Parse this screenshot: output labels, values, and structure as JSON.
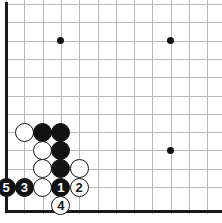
{
  "figure": {
    "kind": "go-board-diagram",
    "title": "",
    "board_region": "bottom-left corner",
    "background_color": "#ffffff",
    "grid_line_color": "#b9b9b9",
    "border_color": "#1a1a1a",
    "black_stone_color": "#121212",
    "white_stone_color": "#ffffff",
    "columns": 12,
    "rows": 11,
    "grid_spacing_px": 18.3,
    "origin_x_px": 6,
    "origin_y_px": 4,
    "stone_diameter_px": 19
  },
  "star_points": [
    {
      "name": "star-point-1",
      "col": 3,
      "row": 2
    },
    {
      "name": "star-point-2",
      "col": 9,
      "row": 2
    },
    {
      "name": "star-point-3",
      "col": 9,
      "row": 8
    }
  ],
  "stones": [
    {
      "id": "white-stone-a",
      "color": "white",
      "label": "",
      "col": 1,
      "row": 7
    },
    {
      "id": "black-stone-b",
      "color": "black",
      "label": "",
      "col": 2,
      "row": 7
    },
    {
      "id": "black-stone-c",
      "color": "black",
      "label": "",
      "col": 3,
      "row": 7
    },
    {
      "id": "white-stone-d",
      "color": "white",
      "label": "",
      "col": 2,
      "row": 8
    },
    {
      "id": "black-stone-e",
      "color": "black",
      "label": "",
      "col": 3,
      "row": 8
    },
    {
      "id": "white-stone-f",
      "color": "white",
      "label": "",
      "col": 2,
      "row": 9
    },
    {
      "id": "black-stone-g",
      "color": "black",
      "label": "",
      "col": 3,
      "row": 9
    },
    {
      "id": "white-stone-h",
      "color": "white",
      "label": "",
      "col": 4,
      "row": 9
    },
    {
      "id": "move-5",
      "color": "black",
      "label": "5",
      "col": 0,
      "row": 10
    },
    {
      "id": "move-3",
      "color": "black",
      "label": "3",
      "col": 1,
      "row": 10
    },
    {
      "id": "white-stone-i",
      "color": "white",
      "label": "",
      "col": 2,
      "row": 10
    },
    {
      "id": "move-1",
      "color": "black",
      "label": "1",
      "col": 3,
      "row": 10
    },
    {
      "id": "move-2",
      "color": "white",
      "label": "2",
      "col": 4,
      "row": 10
    },
    {
      "id": "move-4",
      "color": "white",
      "label": "4",
      "col": 3,
      "row": 11
    }
  ],
  "move_sequence": [
    {
      "move": "1",
      "color": "black"
    },
    {
      "move": "2",
      "color": "white"
    },
    {
      "move": "3",
      "color": "black"
    },
    {
      "move": "4",
      "color": "white"
    },
    {
      "move": "5",
      "color": "black"
    }
  ]
}
